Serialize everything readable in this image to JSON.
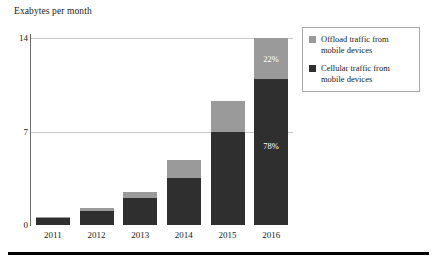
{
  "chart_data": {
    "type": "bar",
    "title": "Exabytes per month",
    "subtitle": "",
    "xlabel": "",
    "ylabel": "Exabytes per month",
    "categories": [
      "2011",
      "2012",
      "2013",
      "2014",
      "2015",
      "2016"
    ],
    "ylim": [
      0,
      14
    ],
    "yticks": [
      0,
      7,
      14
    ],
    "ytick_labels": [
      "0",
      "7",
      "14"
    ],
    "grid": true,
    "stacked": true,
    "legend_position": "top-right",
    "series": [
      {
        "name": "Cellular traffic from mobile devices",
        "color": "#2f2f2f",
        "values": [
          0.55,
          1.05,
          2.0,
          3.5,
          7.0,
          10.9
        ]
      },
      {
        "name": "Offload traffic from mobile devices",
        "color": "#9a9a9a",
        "values": [
          0.05,
          0.25,
          0.45,
          1.4,
          2.3,
          3.1
        ]
      }
    ],
    "annotations": [
      {
        "label": "22%",
        "category": "2016",
        "series": "Offload traffic from mobile devices"
      },
      {
        "label": "78%",
        "category": "2016",
        "series": "Cellular traffic from mobile devices"
      }
    ]
  },
  "axis": {
    "title": "Exabytes per month",
    "ticks": [
      {
        "label": "14",
        "value": 14
      },
      {
        "label": "7",
        "value": 7
      },
      {
        "label": "0",
        "value": 0
      }
    ],
    "categories": [
      {
        "label": "2011"
      },
      {
        "label": "2012"
      },
      {
        "label": "2013"
      },
      {
        "label": "2014"
      },
      {
        "label": "2015"
      },
      {
        "label": "2016"
      }
    ]
  },
  "legend": {
    "entries": [
      {
        "label": "Offload traffic from mobile devices",
        "color": "#9a9a9a"
      },
      {
        "label": "Cellular traffic from mobile devices",
        "color": "#2f2f2f"
      }
    ]
  },
  "bar_labels": {
    "offload_pct": "22%",
    "cellular_pct": "78%"
  },
  "colors": {
    "offload": "#9a9a9a",
    "cellular": "#2f2f2f",
    "gridline": "#c9c9c9",
    "axis": "#6e6e6e",
    "rule": "#000000",
    "text": "#1a1a1a"
  }
}
